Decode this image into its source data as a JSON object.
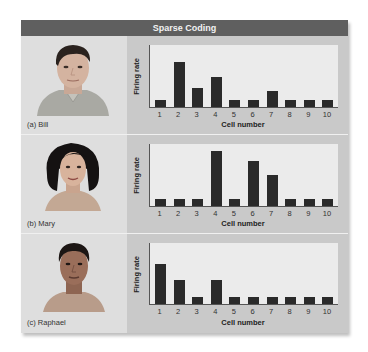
{
  "title": "Sparse Coding",
  "colors": {
    "header_bg": "#5f5f5f",
    "panel_bg": "#c9c9c9",
    "face_panel_bg": "#dedede",
    "plot_bg": "#ebebeb",
    "bar": "#2a2a2a"
  },
  "rows": [
    {
      "caption": "(a) Bill",
      "person": "Bill"
    },
    {
      "caption": "(b) Mary",
      "person": "Mary"
    },
    {
      "caption": "(c) Raphael",
      "person": "Raphael"
    }
  ],
  "axis": {
    "ylabel": "Firing rate",
    "xlabel": "Cell number"
  },
  "chart_data": [
    {
      "type": "bar",
      "title": "(a) Bill",
      "xlabel": "Cell number",
      "ylabel": "Firing rate",
      "categories": [
        "1",
        "2",
        "3",
        "4",
        "5",
        "6",
        "7",
        "8",
        "9",
        "10"
      ],
      "values": [
        1.1,
        7.3,
        3.1,
        4.8,
        1.1,
        1.1,
        2.6,
        1.1,
        1.1,
        1.1
      ],
      "ylim": [
        0,
        10
      ],
      "grid": false
    },
    {
      "type": "bar",
      "title": "(b) Mary",
      "xlabel": "Cell number",
      "ylabel": "Firing rate",
      "categories": [
        "1",
        "2",
        "3",
        "4",
        "5",
        "6",
        "7",
        "8",
        "9",
        "10"
      ],
      "values": [
        1.1,
        1.1,
        1.1,
        8.9,
        1.1,
        7.3,
        5.0,
        1.1,
        1.1,
        1.1
      ],
      "ylim": [
        0,
        10
      ],
      "grid": false
    },
    {
      "type": "bar",
      "title": "(c) Raphael",
      "xlabel": "Cell number",
      "ylabel": "Firing rate",
      "categories": [
        "1",
        "2",
        "3",
        "4",
        "5",
        "6",
        "7",
        "8",
        "9",
        "10"
      ],
      "values": [
        6.6,
        4.0,
        1.1,
        4.0,
        1.1,
        1.1,
        1.1,
        1.1,
        1.1,
        1.1
      ],
      "ylim": [
        0,
        10
      ],
      "grid": false
    }
  ]
}
